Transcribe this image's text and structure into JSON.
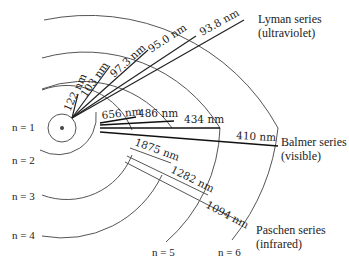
{
  "diagram": {
    "levels": [
      {
        "n": 1,
        "label": "n = 1"
      },
      {
        "n": 2,
        "label": "n = 2"
      },
      {
        "n": 3,
        "label": "n = 3"
      },
      {
        "n": 4,
        "label": "n = 4"
      },
      {
        "n": 5,
        "label": "n = 5"
      },
      {
        "n": 6,
        "label": "n = 6"
      }
    ],
    "series": {
      "lyman": {
        "name": "Lyman series",
        "region": "(ultraviolet)",
        "transitions": [
          {
            "from": 2,
            "to": 1,
            "label": "122 nm"
          },
          {
            "from": 3,
            "to": 1,
            "label": "103 nm"
          },
          {
            "from": 4,
            "to": 1,
            "label": "97.3 nm"
          },
          {
            "from": 5,
            "to": 1,
            "label": "95.0 nm"
          },
          {
            "from": 6,
            "to": 1,
            "label": "93.8 nm"
          }
        ]
      },
      "balmer": {
        "name": "Balmer series",
        "region": "(visible)",
        "transitions": [
          {
            "from": 3,
            "to": 2,
            "label": "656 nm"
          },
          {
            "from": 4,
            "to": 2,
            "label": "486 nm"
          },
          {
            "from": 5,
            "to": 2,
            "label": "434 nm"
          },
          {
            "from": 6,
            "to": 2,
            "label": "410 nm"
          }
        ]
      },
      "paschen": {
        "name": "Paschen series",
        "region": "(infrared)",
        "transitions": [
          {
            "from": 4,
            "to": 3,
            "label": "1875 nm"
          },
          {
            "from": 5,
            "to": 3,
            "label": "1282 nm"
          },
          {
            "from": 6,
            "to": 3,
            "label": "1094 nm"
          }
        ]
      }
    }
  }
}
